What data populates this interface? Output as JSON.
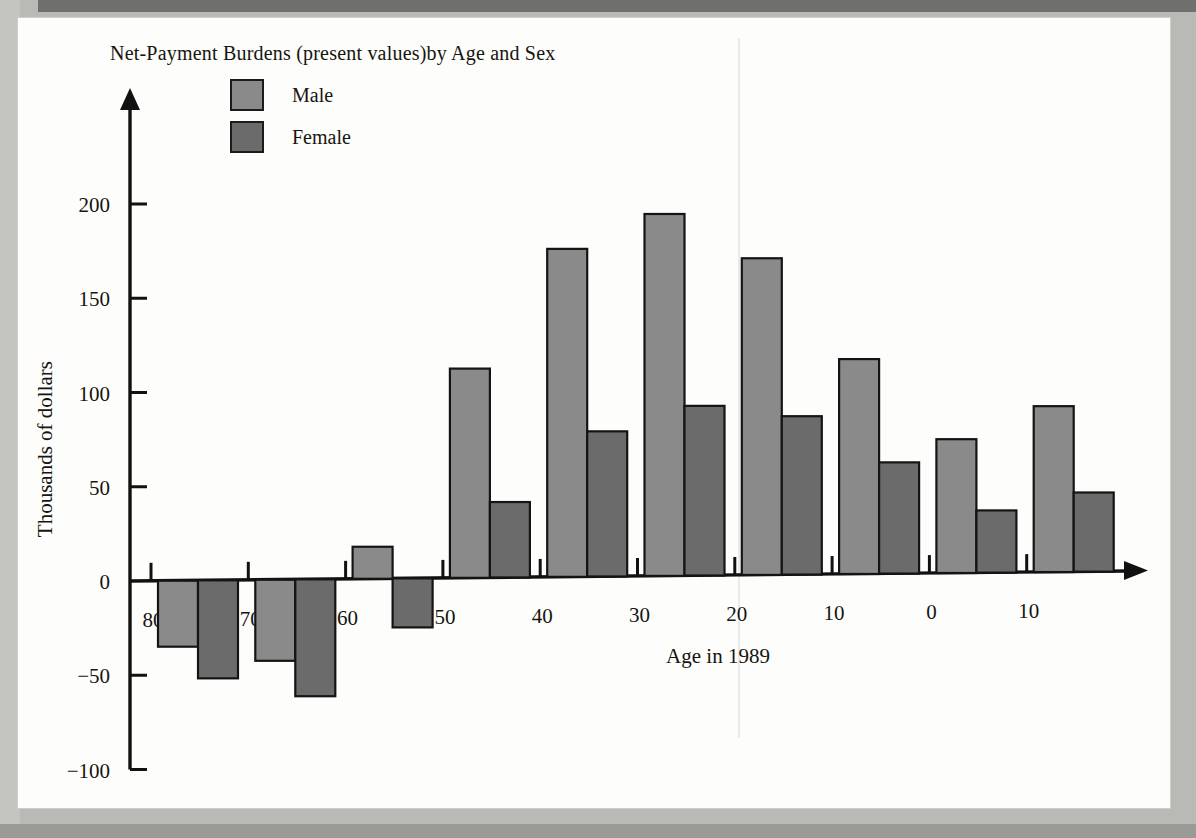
{
  "chart_data": {
    "type": "bar",
    "title": "Net-Payment Burdens (present values)by Age and Sex",
    "xlabel": "Age in 1989",
    "ylabel": "Thousands of dollars",
    "categories": [
      "80",
      "70",
      "60",
      "50",
      "40",
      "30",
      "20",
      "10",
      "0",
      "10"
    ],
    "series": [
      {
        "name": "Male",
        "color": "#8a8a8a",
        "values": [
          -35,
          -43,
          17,
          111,
          174,
          192,
          168,
          114,
          71,
          88
        ]
      },
      {
        "name": "Female",
        "color": "#6b6b6b",
        "values": [
          -52,
          -62,
          -26,
          40,
          77,
          90,
          84,
          59,
          33,
          42
        ]
      }
    ],
    "ylim": [
      -100,
      215
    ],
    "yticks": [
      200,
      150,
      100,
      50,
      0,
      -50,
      -100
    ],
    "ytick_labels": [
      "200",
      "150",
      "100",
      "50",
      "0",
      "−50",
      "−100"
    ],
    "grid": false,
    "legend_position": "top-left"
  },
  "legend": {
    "items": [
      {
        "label": "Male",
        "color": "#8a8a8a"
      },
      {
        "label": "Female",
        "color": "#6b6b6b"
      }
    ]
  },
  "colors": {
    "male": "#8a8a8a",
    "female": "#6b6b6b",
    "axis": "#111111",
    "page": "#fdfdfb",
    "surround": "#b9b9b6"
  }
}
